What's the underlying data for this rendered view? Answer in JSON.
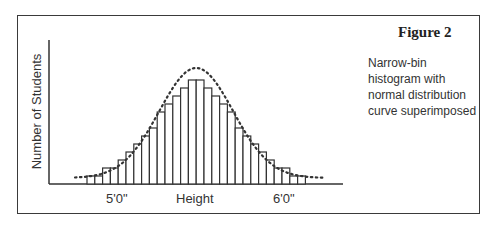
{
  "figure": {
    "title": "Figure 2",
    "description": "Narrow-bin histogram with normal distribution curve superimposed"
  },
  "chart_data": {
    "type": "bar",
    "title": "Figure 2",
    "subtitle": "Narrow-bin histogram with normal distribution curve superimposed",
    "xlabel": "Height",
    "ylabel": "Number of Students",
    "x_tick_labels": [
      "5'0\"",
      "6'0\""
    ],
    "grid": false,
    "legend": null,
    "categories": [
      "b1",
      "b2",
      "b3",
      "b4",
      "b5",
      "b6",
      "b7",
      "b8",
      "b9",
      "b10",
      "b11",
      "b12",
      "b13",
      "b14",
      "b15",
      "b16",
      "b17",
      "b18",
      "b19",
      "b20",
      "b21",
      "b22",
      "b23",
      "b24",
      "b25",
      "b26",
      "b27",
      "b28"
    ],
    "values": [
      1,
      1,
      2,
      2,
      3,
      4,
      5,
      6,
      7,
      9,
      10,
      11,
      12,
      13,
      13,
      12,
      11,
      10,
      9,
      7,
      6,
      5,
      4,
      3,
      2,
      2,
      1,
      1
    ],
    "overlay": {
      "type": "line",
      "style": "dotted",
      "name": "normal distribution curve"
    },
    "ylim": [
      0,
      14
    ]
  },
  "axis": {
    "y_label": "Number of Students",
    "x_label": "Height",
    "tick_left": "5'0\"",
    "tick_right": "6'0\""
  }
}
